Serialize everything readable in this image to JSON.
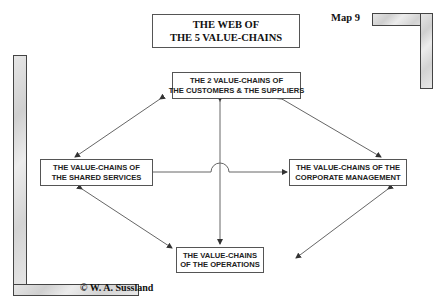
{
  "title": {
    "line1": "THE WEB OF",
    "line2": "THE 5 VALUE-CHAINS"
  },
  "map_label": "Map 9",
  "copyright": "© W. A. Sussland",
  "nodes": {
    "top": {
      "line1": "THE 2 VALUE-CHAINS OF",
      "line2": "THE CUSTOMERS & THE SUPPLIERS"
    },
    "left": {
      "line1": "THE VALUE-CHAINS OF",
      "line2": "THE SHARED SERVICES"
    },
    "right": {
      "line1": "THE VALUE-CHAINS OF THE",
      "line2": "CORPORATE MANAGEMENT"
    },
    "bottom": {
      "line1": "THE VALUE-CHAINS",
      "line2": "OF THE OPERATIONS"
    }
  },
  "edges": [
    {
      "from": "top",
      "to": "left",
      "style": "double-arrow"
    },
    {
      "from": "top",
      "to": "right",
      "style": "double-arrow"
    },
    {
      "from": "top",
      "to": "bottom",
      "style": "double-arrow"
    },
    {
      "from": "left",
      "to": "right",
      "style": "arrow"
    },
    {
      "from": "left",
      "to": "bottom",
      "style": "double-arrow"
    },
    {
      "from": "right",
      "to": "bottom",
      "style": "double-arrow"
    }
  ],
  "colors": {
    "line": "#555555",
    "box_border": "#555555",
    "frame_fill": "#d9d9d9"
  }
}
